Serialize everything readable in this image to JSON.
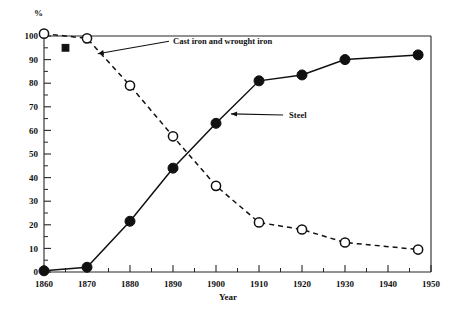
{
  "chart_data": {
    "type": "line",
    "title": "",
    "subtitle": "",
    "xlabel": "Year",
    "ylabel": "%",
    "xlim": [
      1860,
      1950
    ],
    "ylim": [
      0,
      100
    ],
    "x_major_step": 10,
    "x_minor_step": 5,
    "y_major_step": 10,
    "y_minor_step": 5,
    "grid": false,
    "legend_position": "inline-annotations",
    "xticklabels": [
      "1860",
      "1870",
      "1880",
      "1890",
      "1900",
      "1910",
      "1920",
      "1930",
      "1940",
      "1950"
    ],
    "yticklabels": [
      "0",
      "10",
      "20",
      "30",
      "40",
      "50",
      "60",
      "70",
      "80",
      "90",
      "100"
    ],
    "series": [
      {
        "name": "Cast iron and wrought iron",
        "marker": "open-circle",
        "line": "dashed",
        "x": [
          1860,
          1870,
          1880,
          1890,
          1900,
          1910,
          1920,
          1930,
          1947
        ],
        "values": [
          101,
          99,
          79,
          57.5,
          36.5,
          21,
          18,
          12.5,
          9.5
        ]
      },
      {
        "name": "Steel",
        "marker": "filled-circle",
        "line": "solid",
        "x": [
          1860,
          1870,
          1880,
          1890,
          1900,
          1910,
          1920,
          1930,
          1947
        ],
        "values": [
          0.5,
          2,
          21.5,
          44,
          63,
          81,
          83.5,
          90,
          92
        ]
      },
      {
        "name": "isolated-point",
        "marker": "filled-square",
        "line": "none",
        "x": [
          1865
        ],
        "values": [
          95
        ]
      }
    ],
    "annotations": [
      {
        "text": "Cast iron and wrought iron",
        "label_x": 1890,
        "label_y": 98,
        "arrow_to_x": 1872.5,
        "arrow_to_y": 92.5
      },
      {
        "text": "Steel",
        "label_x": 1917,
        "label_y": 66.5,
        "arrow_to_x": 1903.5,
        "arrow_to_y": 67
      }
    ]
  },
  "labels": {
    "y_axis_unit": "%",
    "x_axis_title": "Year",
    "series_cast_iron": "Cast iron and wrought iron",
    "series_steel": "Steel"
  },
  "colors": {
    "ink": "#111111",
    "background": "#ffffff"
  }
}
